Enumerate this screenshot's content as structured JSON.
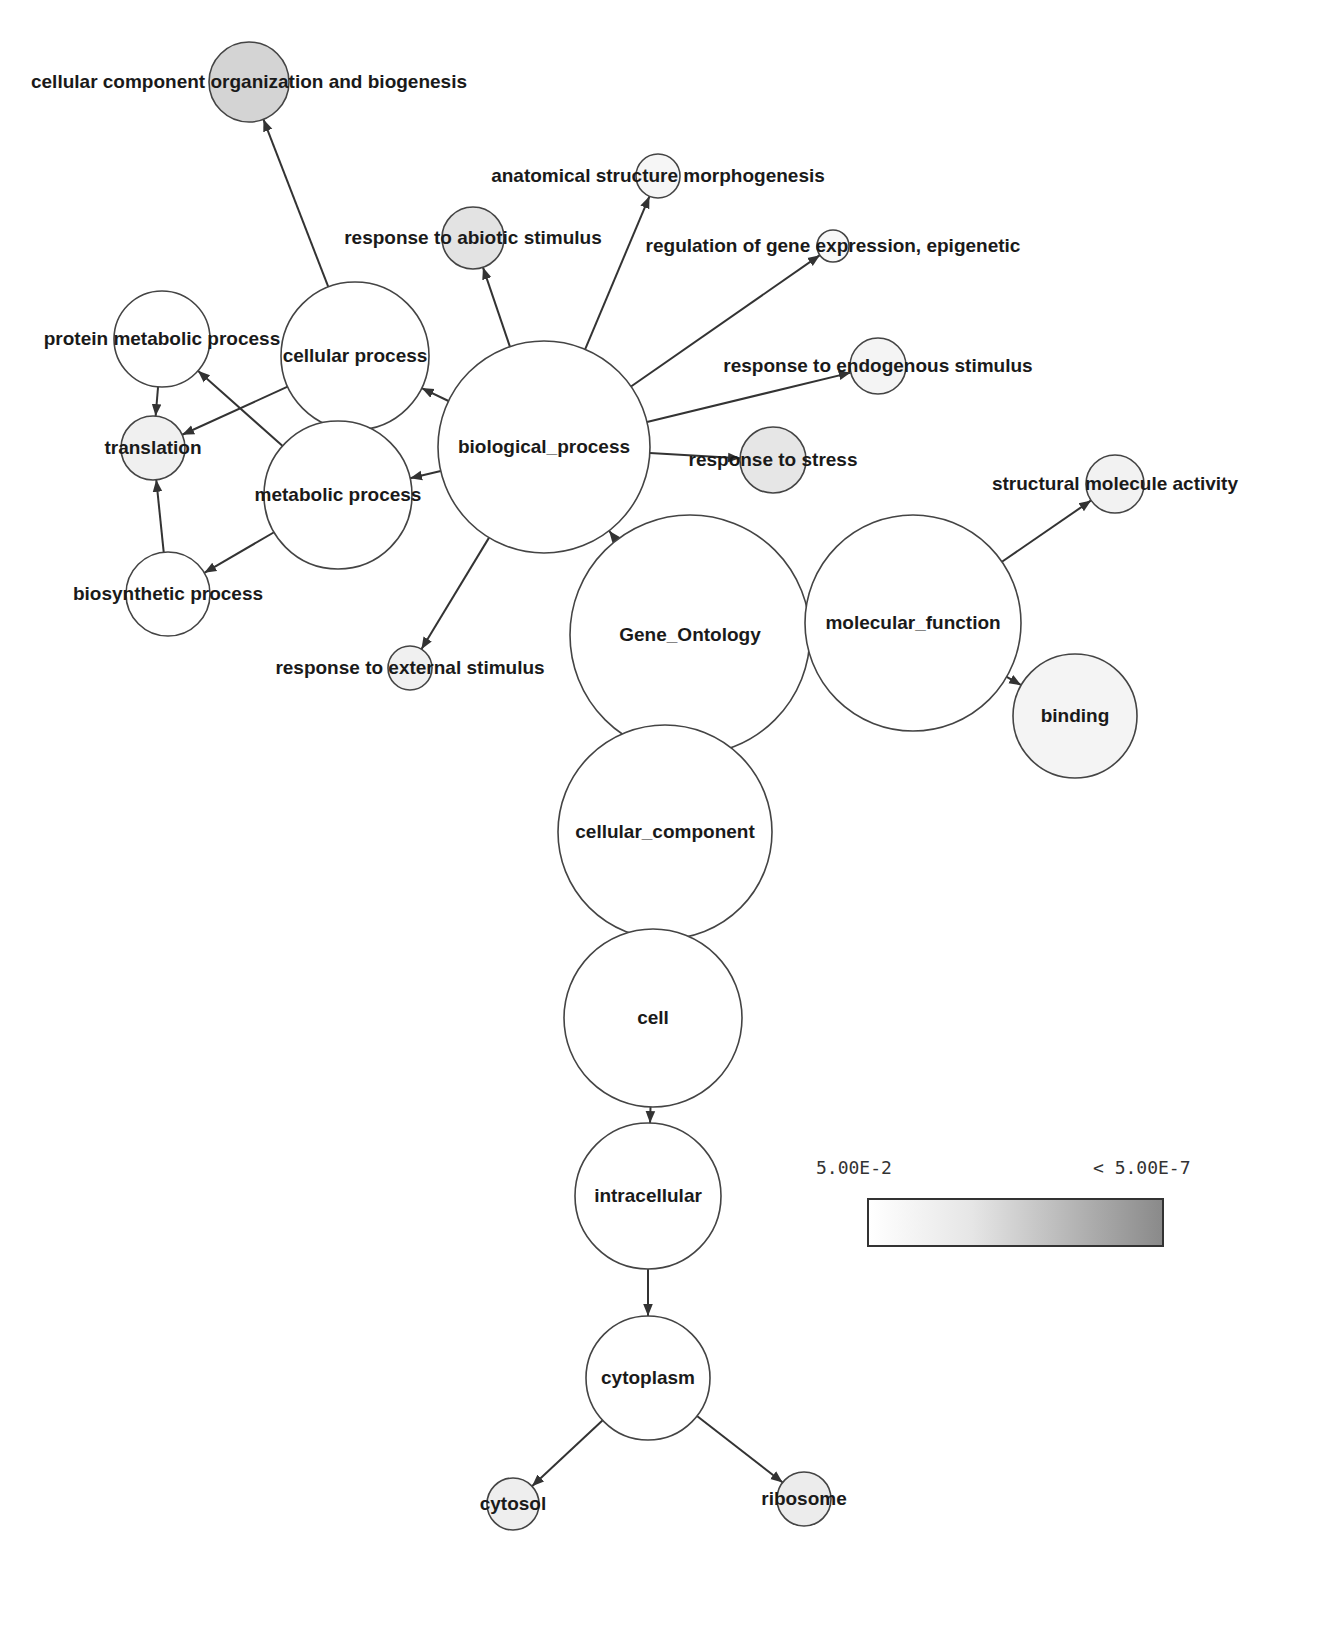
{
  "diagram": {
    "type": "gene-ontology-enrichment-graph",
    "nodes": [
      {
        "id": "gene_ontology",
        "label": "Gene_Ontology",
        "x": 690,
        "y": 635,
        "r": 120,
        "fill": "#ffffff"
      },
      {
        "id": "biological_process",
        "label": "biological_process",
        "x": 544,
        "y": 447,
        "r": 106,
        "fill": "#ffffff"
      },
      {
        "id": "molecular_function",
        "label": "molecular_function",
        "x": 913,
        "y": 623,
        "r": 108,
        "fill": "#ffffff"
      },
      {
        "id": "cellular_component",
        "label": "cellular_component",
        "x": 665,
        "y": 832,
        "r": 107,
        "fill": "#ffffff"
      },
      {
        "id": "cell",
        "label": "cell",
        "x": 653,
        "y": 1018,
        "r": 89,
        "fill": "#ffffff"
      },
      {
        "id": "intracellular",
        "label": "intracellular",
        "x": 648,
        "y": 1196,
        "r": 73,
        "fill": "#ffffff"
      },
      {
        "id": "cytoplasm",
        "label": "cytoplasm",
        "x": 648,
        "y": 1378,
        "r": 62,
        "fill": "#ffffff"
      },
      {
        "id": "cytosol",
        "label": "cytosol",
        "x": 513,
        "y": 1504,
        "r": 26,
        "fill": "#eeeeee"
      },
      {
        "id": "ribosome",
        "label": "ribosome",
        "x": 804,
        "y": 1499,
        "r": 27,
        "fill": "#ececec"
      },
      {
        "id": "cellular_process",
        "label": "cellular process",
        "x": 355,
        "y": 356,
        "r": 74,
        "fill": "#ffffff"
      },
      {
        "id": "metabolic_process",
        "label": "metabolic process",
        "x": 338,
        "y": 495,
        "r": 74,
        "fill": "#ffffff"
      },
      {
        "id": "protein_metabolic_process",
        "label": "protein metabolic process",
        "x": 162,
        "y": 339,
        "r": 48,
        "fill": "#ffffff"
      },
      {
        "id": "translation",
        "label": "translation",
        "x": 153,
        "y": 448,
        "r": 32,
        "fill": "#f0f0f0"
      },
      {
        "id": "biosynthetic_process",
        "label": "biosynthetic process",
        "x": 168,
        "y": 594,
        "r": 42,
        "fill": "#ffffff"
      },
      {
        "id": "cellular_component_organization",
        "label": "cellular component organization and biogenesis",
        "x": 249,
        "y": 82,
        "r": 40,
        "fill": "#d4d4d4"
      },
      {
        "id": "response_to_abiotic_stimulus",
        "label": "response to abiotic stimulus",
        "x": 473,
        "y": 238,
        "r": 31,
        "fill": "#e3e3e3"
      },
      {
        "id": "anatomical_structure_morphogenesis",
        "label": "anatomical structure morphogenesis",
        "x": 658,
        "y": 176,
        "r": 22,
        "fill": "#f6f6f6"
      },
      {
        "id": "regulation_of_gene_expression",
        "label": "regulation of gene expression, epigenetic",
        "x": 833,
        "y": 246,
        "r": 16,
        "fill": "#f8f8f8"
      },
      {
        "id": "response_to_endogenous_stimulus",
        "label": "response to endogenous stimulus",
        "x": 878,
        "y": 366,
        "r": 28,
        "fill": "#f4f4f4"
      },
      {
        "id": "response_to_stress",
        "label": "response to stress",
        "x": 773,
        "y": 460,
        "r": 33,
        "fill": "#e6e6e6"
      },
      {
        "id": "response_to_external_stimulus",
        "label": "response to external stimulus",
        "x": 410,
        "y": 668,
        "r": 22,
        "fill": "#f0f0f0"
      },
      {
        "id": "structural_molecule_activity",
        "label": "structural molecule activity",
        "x": 1115,
        "y": 484,
        "r": 29,
        "fill": "#f2f2f2"
      },
      {
        "id": "binding",
        "label": "binding",
        "x": 1075,
        "y": 716,
        "r": 62,
        "fill": "#f4f4f4"
      }
    ],
    "edges": [
      {
        "from": "gene_ontology",
        "to": "biological_process"
      },
      {
        "from": "gene_ontology",
        "to": "molecular_function"
      },
      {
        "from": "gene_ontology",
        "to": "cellular_component"
      },
      {
        "from": "biological_process",
        "to": "cellular_process"
      },
      {
        "from": "biological_process",
        "to": "metabolic_process"
      },
      {
        "from": "biological_process",
        "to": "response_to_abiotic_stimulus"
      },
      {
        "from": "biological_process",
        "to": "anatomical_structure_morphogenesis"
      },
      {
        "from": "biological_process",
        "to": "regulation_of_gene_expression"
      },
      {
        "from": "biological_process",
        "to": "response_to_endogenous_stimulus"
      },
      {
        "from": "biological_process",
        "to": "response_to_stress"
      },
      {
        "from": "biological_process",
        "to": "response_to_external_stimulus"
      },
      {
        "from": "cellular_process",
        "to": "cellular_component_organization"
      },
      {
        "from": "cellular_process",
        "to": "translation"
      },
      {
        "from": "metabolic_process",
        "to": "protein_metabolic_process"
      },
      {
        "from": "metabolic_process",
        "to": "biosynthetic_process"
      },
      {
        "from": "protein_metabolic_process",
        "to": "translation"
      },
      {
        "from": "biosynthetic_process",
        "to": "translation"
      },
      {
        "from": "molecular_function",
        "to": "structural_molecule_activity"
      },
      {
        "from": "molecular_function",
        "to": "binding"
      },
      {
        "from": "cellular_component",
        "to": "cell"
      },
      {
        "from": "cell",
        "to": "intracellular"
      },
      {
        "from": "intracellular",
        "to": "cytoplasm"
      },
      {
        "from": "cytoplasm",
        "to": "cytosol"
      },
      {
        "from": "cytoplasm",
        "to": "ribosome"
      }
    ]
  },
  "legend": {
    "min_label": "5.00E-2",
    "max_label": "< 5.00E-7",
    "color_start": "#ffffff",
    "color_end": "#8a8a8a",
    "stroke": "#333333"
  },
  "colors": {
    "edge": "#333333",
    "node_stroke": "#444444",
    "background": "#ffffff"
  }
}
